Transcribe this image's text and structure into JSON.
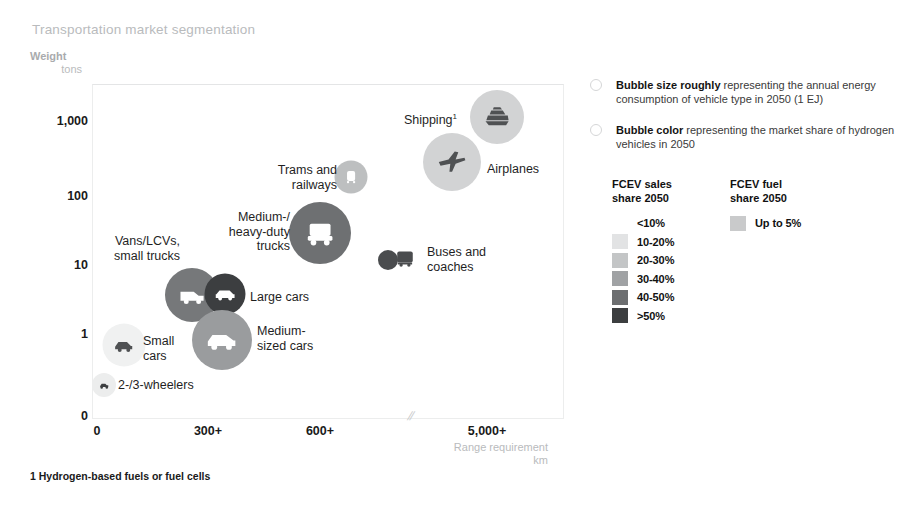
{
  "chart_data": {
    "type": "scatter",
    "title": "Transportation market segmentation",
    "xlabel": "Range requirement",
    "xlabel_unit": "km",
    "ylabel": "Weight",
    "ylabel_unit": "tons",
    "xticks": [
      "0",
      "300+",
      "600+",
      "5,000+"
    ],
    "yticks": [
      "1,000",
      "100",
      "10",
      "1",
      "0"
    ],
    "axis_break_marker": "//",
    "grid": false,
    "legend_position": "right",
    "points": [
      {
        "name": "Shipping",
        "label": "Shipping",
        "footnote_marker": "1",
        "icon": "ship-icon",
        "weight_tons": 1000,
        "range_km": "5,000+",
        "size_px": 54,
        "color": "#d2d3d4",
        "fcev_sales_share_2050": "<10%"
      },
      {
        "name": "Airplanes",
        "label": "Airplanes",
        "icon": "airplane-icon",
        "weight_tons": 300,
        "range_km": "5,000+",
        "size_px": 58,
        "color": "#d2d3d4",
        "fcev_sales_share_2050": "<10%"
      },
      {
        "name": "Trams and railways",
        "label": "Trams and\nrailways",
        "icon": "tram-icon",
        "weight_tons": 150,
        "range_km": "600+",
        "size_px": 33,
        "color": "#bdbfc0",
        "fcev_sales_share_2050": "10-20%"
      },
      {
        "name": "Medium-/heavy-duty trucks",
        "label": "Medium-/\nheavy-duty\ntrucks",
        "icon": "truck-icon",
        "weight_tons": 30,
        "range_km": "600+",
        "size_px": 62,
        "color": "#6e7072",
        "fcev_sales_share_2050": "40-50%"
      },
      {
        "name": "Buses and coaches",
        "label": "Buses and\ncoaches",
        "icon": "bus-icon",
        "weight_tons": 12,
        "range_km": "700",
        "size_px": 20,
        "color": "#4a4c4e",
        "fcev_sales_share_2050": ">50%"
      },
      {
        "name": "Vans/LCVs, small trucks",
        "label": "Vans/LCVs,\nsmall trucks",
        "icon": "van-icon",
        "weight_tons": 4,
        "range_km": "300+",
        "size_px": 54,
        "color": "#76787a",
        "fcev_sales_share_2050": "40-50%"
      },
      {
        "name": "Large cars",
        "label": "Large cars",
        "icon": "large-car-icon",
        "weight_tons": 2.5,
        "range_km": "450",
        "size_px": 41,
        "color": "#3c3e40",
        "fcev_sales_share_2050": ">50%"
      },
      {
        "name": "Medium-sized cars",
        "label": "Medium-\nsized cars",
        "icon": "medium-car-icon",
        "weight_tons": 1.3,
        "range_km": "400",
        "size_px": 60,
        "color": "#9a9c9e",
        "fcev_sales_share_2050": "20-30%"
      },
      {
        "name": "Small cars",
        "label": "Small\ncars",
        "icon": "small-car-icon",
        "weight_tons": 1,
        "range_km": "150",
        "size_px": 43,
        "color": "#f0f1f1",
        "fcev_sales_share_2050": "<10%"
      },
      {
        "name": "2-/3-wheelers",
        "label": "2-/3-wheelers",
        "icon": "scooter-icon",
        "weight_tons": 0.2,
        "range_km": "100",
        "size_px": 24,
        "color": "#eceded",
        "fcev_sales_share_2050": "<10%"
      }
    ]
  },
  "legend": {
    "notes": [
      {
        "bold": "Bubble size roughly",
        "rest": " representing the annual energy consumption of vehicle type in 2050 (1 EJ)"
      },
      {
        "bold": "Bubble color",
        "rest": " representing the market share of hydrogen vehicles in 2050"
      }
    ],
    "sales": {
      "heading": "FCEV sales\nshare 2050",
      "rows": [
        {
          "label": "<10%",
          "color": "#ffffff"
        },
        {
          "label": "10-20%",
          "color": "#e2e3e4"
        },
        {
          "label": "20-30%",
          "color": "#c3c5c6"
        },
        {
          "label": "30-40%",
          "color": "#a0a2a4"
        },
        {
          "label": "40-50%",
          "color": "#6c6e70"
        },
        {
          "label": ">50%",
          "color": "#3c3e40"
        }
      ]
    },
    "fuel": {
      "heading": "FCEV fuel\nshare 2050",
      "rows": [
        {
          "label": "Up to 5%",
          "color": "#c9cacb"
        }
      ]
    }
  },
  "footnote": "1 Hydrogen-based fuels or fuel cells"
}
